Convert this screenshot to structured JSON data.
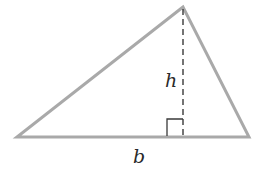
{
  "figure": {
    "type": "triangle-area-diagram",
    "labels": {
      "height": "h",
      "base": "b"
    },
    "colors": {
      "sides": "#a9a9a9",
      "height_line": "#3a3a3a",
      "right_angle": "#3a3a3a",
      "text": "#2a2a2a",
      "background": "#ffffff"
    },
    "vertices": {
      "apex": [
        183,
        7
      ],
      "bottom_left": [
        17,
        137
      ],
      "bottom_right": [
        249,
        137
      ]
    },
    "height_foot": [
      183,
      137
    ],
    "right_angle_marker_size": 16
  }
}
